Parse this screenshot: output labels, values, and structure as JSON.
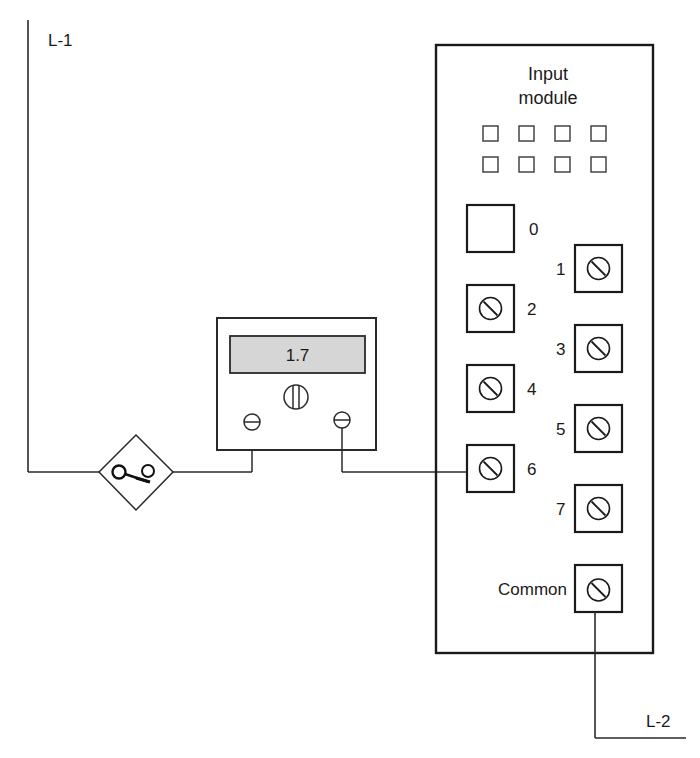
{
  "diagram": {
    "type": "wiring-diagram",
    "lines": {
      "line1_label": "L-1",
      "line2_label": "L-2"
    },
    "switch": {
      "symbol": "switch-icon"
    },
    "meter": {
      "reading": "1.7",
      "adjust_knob": "knob-icon",
      "display_color": "#d6d6d6"
    },
    "module": {
      "title_line1": "Input",
      "title_line2": "module",
      "indicator_count": 8,
      "terminals": [
        {
          "label": "0",
          "has_screw": false
        },
        {
          "label": "1",
          "has_screw": true
        },
        {
          "label": "2",
          "has_screw": true
        },
        {
          "label": "3",
          "has_screw": true
        },
        {
          "label": "4",
          "has_screw": true
        },
        {
          "label": "5",
          "has_screw": true
        },
        {
          "label": "6",
          "has_screw": true
        },
        {
          "label": "7",
          "has_screw": true
        }
      ],
      "common_label": "Common"
    }
  }
}
